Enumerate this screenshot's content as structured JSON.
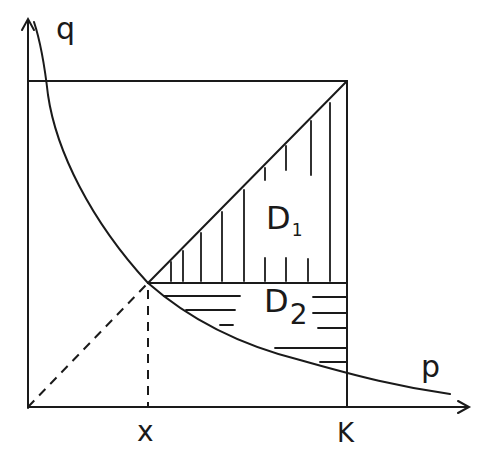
{
  "diagram": {
    "axes": {
      "vertical_label": "q",
      "horizontal_label": "p"
    },
    "ticks": {
      "x_label": "x",
      "k_label": "K"
    },
    "regions": [
      {
        "id": "D1",
        "main": "D",
        "sub": "1",
        "hatch": "vertical"
      },
      {
        "id": "D2",
        "main": "D",
        "sub": "2",
        "hatch": "horizontal"
      }
    ],
    "colors": {
      "ink": "#1a1a1a",
      "background": "#ffffff"
    }
  }
}
